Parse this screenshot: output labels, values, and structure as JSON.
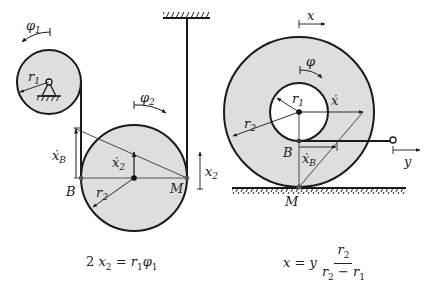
{
  "figure": {
    "left_diagram": {
      "labels": {
        "phi1": "φ",
        "phi1_sub": "1",
        "r1": "r",
        "r1_sub": "1",
        "phi2": "φ",
        "phi2_sub": "2",
        "xB_dot": "ẋ",
        "xB_sub": "B",
        "x2_dot": "ẋ",
        "x2_dot_sub": "2",
        "x2": "x",
        "x2_sub": "2",
        "B": "B",
        "M": "M",
        "r2": "r",
        "r2_sub": "2"
      },
      "equation": {
        "coef": "2",
        "lhs_var": "x",
        "lhs_sub": "2",
        "equals": "=",
        "rhs_var1": "r",
        "rhs_sub1": "1",
        "rhs_var2": "φ",
        "rhs_sub2": "1"
      }
    },
    "right_diagram": {
      "labels": {
        "x": "x",
        "phi": "φ",
        "r1": "r",
        "r1_sub": "1",
        "x_dot": "ẋ",
        "r2": "r",
        "r2_sub": "2",
        "B": "B",
        "xB_dot": "ẋ",
        "xB_sub": "B",
        "y": "y",
        "M": "M"
      },
      "equation": {
        "lhs": "x",
        "equals": "=",
        "factor": "y",
        "num_var": "r",
        "num_sub": "2",
        "den_var1": "r",
        "den_sub1": "2",
        "minus": "−",
        "den_var2": "r",
        "den_sub2": "1"
      }
    },
    "colors": {
      "disk_fill": "#dedede",
      "stroke": "#1a1a1a",
      "thin_line": "#333333",
      "point": "#555555"
    }
  }
}
